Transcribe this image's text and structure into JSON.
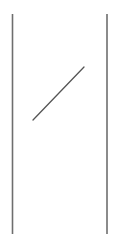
{
  "canvas": {
    "width": 114,
    "height": 244,
    "background": "#ffffff"
  },
  "strokes": {
    "color": "#6e6e6e",
    "left_bar": {
      "x": 12.5,
      "y1": 14,
      "y2": 234,
      "width": 1.6
    },
    "right_bar": {
      "x": 107,
      "y1": 14,
      "y2": 234,
      "width": 1.6
    },
    "diagonal": {
      "x1": 33,
      "y1": 120,
      "x2": 84,
      "y2": 67,
      "width": 1.3,
      "color": "#555555"
    }
  }
}
